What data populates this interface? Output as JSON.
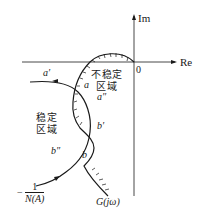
{
  "diagram": {
    "axes": {
      "real_label": "Re",
      "imag_label": "Im",
      "origin_label": "0"
    },
    "regions": {
      "unstable": "不稳定\n区域",
      "unstable_line1": "不稳定",
      "unstable_line2": "区域",
      "stable_line1": "稳定",
      "stable_line2": "区域"
    },
    "points": {
      "a_prime": "a′",
      "a": "a",
      "a_double_prime": "a″",
      "b_prime": "b′",
      "b": "b",
      "b_double_prime": "b″"
    },
    "curves": {
      "describing_function": {
        "label_prefix": "−",
        "numerator": "1",
        "denominator": "N(A)"
      },
      "nyquist": {
        "label": "G(jω)"
      }
    },
    "colors": {
      "line": "#1a1a1a",
      "background": "#ffffff"
    }
  }
}
